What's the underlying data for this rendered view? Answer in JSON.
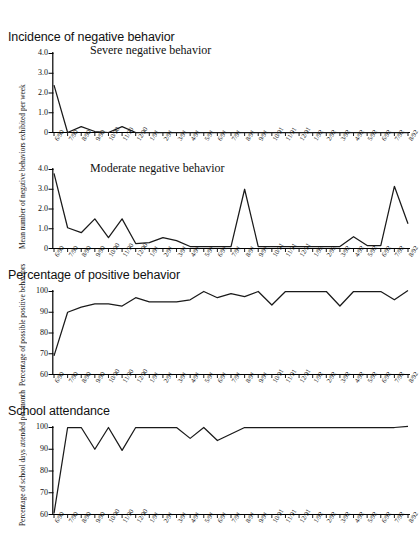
{
  "figure": {
    "background": "#ffffff",
    "line_color": "#1a1a1a",
    "axis_color": "#000000"
  },
  "panels": [
    {
      "id": "severe",
      "title": "Incidence of negative behavior",
      "inner_label": "Severe negative behavior",
      "ylabel": "Mean number of negative behaviors exhibited per week",
      "yticks": [
        "4.0",
        "3.0",
        "2.0",
        "1.0",
        "0"
      ]
    },
    {
      "id": "moderate",
      "title": "",
      "inner_label": "Moderate negative behavior",
      "ylabel": "Mean number of negative behaviors exhibited per week",
      "yticks": [
        "4.0",
        "3.0",
        "2.0",
        "1.0",
        "0"
      ]
    },
    {
      "id": "positive",
      "title": "Percentage of positive behavior",
      "inner_label": "",
      "ylabel": "Percentage of possible positive behaviors",
      "yticks": [
        "100",
        "90",
        "80",
        "70",
        "60"
      ]
    },
    {
      "id": "attendance",
      "title": "School attendance",
      "inner_label": "",
      "ylabel": "Percentage of school days attended per month",
      "yticks": [
        "100",
        "90",
        "80",
        "70",
        "60"
      ]
    }
  ],
  "chart_data": [
    {
      "type": "line",
      "id": "severe-negative-behavior",
      "title": "Incidence of negative behavior",
      "annotation": "Severe negative behavior",
      "xlabel": "",
      "ylabel": "Mean number of negative behaviors exhibited per week",
      "ylim": [
        0,
        4.0
      ],
      "yticks": [
        0,
        1.0,
        2.0,
        3.0,
        4.0
      ],
      "grid": false,
      "legend": "none",
      "x": [
        "6/90",
        "7/90",
        "8/90",
        "9/90",
        "10/90",
        "11/90",
        "12/90",
        "1/91",
        "2/91",
        "3/91",
        "4/91",
        "5/91",
        "6/91",
        "7/91",
        "8/91",
        "9/91",
        "10/91",
        "11/91",
        "12/91",
        "1/92",
        "2/92",
        "3/92",
        "4/92",
        "5/92",
        "6/92",
        "7/92",
        "8/92"
      ],
      "values": [
        2.4,
        0.0,
        0.3,
        0.05,
        0.0,
        0.3,
        0.0,
        0.0,
        0.0,
        0.0,
        0.0,
        0.0,
        0.0,
        0.0,
        0.0,
        0.0,
        0.0,
        0.0,
        0.0,
        0.0,
        0.0,
        0.0,
        0.0,
        0.0,
        0.0,
        0.0,
        0.0
      ]
    },
    {
      "type": "line",
      "id": "moderate-negative-behavior",
      "title": "",
      "annotation": "Moderate negative behavior",
      "xlabel": "",
      "ylabel": "Mean number of negative behaviors exhibited per week",
      "ylim": [
        0,
        4.0
      ],
      "yticks": [
        0,
        1.0,
        2.0,
        3.0,
        4.0
      ],
      "grid": false,
      "legend": "none",
      "x": [
        "6/90",
        "7/90",
        "8/90",
        "9/90",
        "10/90",
        "11/90",
        "12/90",
        "1/91",
        "2/91",
        "3/91",
        "4/91",
        "5/91",
        "6/91",
        "7/91",
        "8/91",
        "9/91",
        "10/91",
        "11/91",
        "12/91",
        "1/92",
        "2/92",
        "3/92",
        "4/92",
        "5/92",
        "6/92",
        "7/92",
        "8/92"
      ],
      "values": [
        3.8,
        1.05,
        0.8,
        1.5,
        0.55,
        1.5,
        0.25,
        0.3,
        0.55,
        0.4,
        0.1,
        0.1,
        0.1,
        0.1,
        3.0,
        0.1,
        0.1,
        0.1,
        0.1,
        0.1,
        0.1,
        0.1,
        0.6,
        0.15,
        0.15,
        3.15,
        1.25
      ]
    },
    {
      "type": "line",
      "id": "percentage-positive-behavior",
      "title": "Percentage of positive behavior",
      "annotation": "",
      "xlabel": "",
      "ylabel": "Percentage of possible positive behaviors",
      "ylim": [
        60,
        100
      ],
      "yticks": [
        60,
        70,
        80,
        90,
        100
      ],
      "grid": false,
      "legend": "none",
      "x": [
        "6/90",
        "7/90",
        "8/90",
        "9/90",
        "10/90",
        "11/90",
        "12/90",
        "1/91",
        "2/91",
        "3/91",
        "4/91",
        "5/91",
        "6/91",
        "7/91",
        "8/91",
        "9/91",
        "10/91",
        "11/91",
        "12/91",
        "1/92",
        "2/92",
        "3/92",
        "4/92",
        "5/92",
        "6/92",
        "7/92",
        "8/92"
      ],
      "values": [
        69,
        90,
        92.5,
        94,
        94,
        93,
        97,
        95,
        95,
        95,
        96,
        100,
        97,
        99,
        97.5,
        100,
        93.5,
        100,
        100,
        100,
        100,
        93,
        100,
        100,
        100,
        96,
        100.5
      ]
    },
    {
      "type": "line",
      "id": "school-attendance",
      "title": "School attendance",
      "annotation": "",
      "xlabel": "",
      "ylabel": "Percentage of school days attended per month",
      "ylim": [
        60,
        100
      ],
      "yticks": [
        60,
        70,
        80,
        90,
        100
      ],
      "grid": false,
      "legend": "none",
      "x": [
        "6/90",
        "7/90",
        "8/90",
        "9/90",
        "10/90",
        "11/90",
        "12/90",
        "1/91",
        "2/91",
        "3/91",
        "4/91",
        "5/91",
        "6/91",
        "7/91",
        "8/91",
        "9/91",
        "10/91",
        "11/91",
        "12/91",
        "1/92",
        "2/92",
        "3/92",
        "4/92",
        "5/92",
        "6/92",
        "7/92",
        "8/92"
      ],
      "values": [
        60.5,
        100,
        100,
        90,
        100,
        89.5,
        100,
        100,
        100,
        100,
        95,
        100,
        94,
        97,
        100,
        100,
        100,
        100,
        100,
        100,
        100,
        100,
        100,
        100,
        100,
        100,
        100.5
      ]
    }
  ],
  "footer_note": ""
}
